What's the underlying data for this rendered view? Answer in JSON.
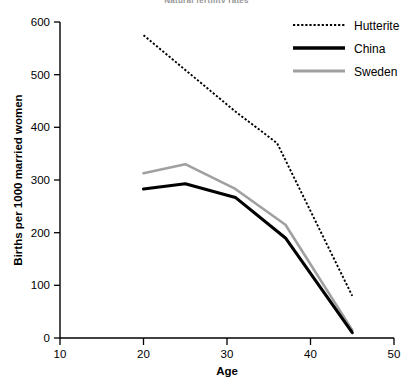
{
  "chart_data": {
    "type": "line",
    "title": "Natural fertility rates",
    "xlabel": "Age",
    "ylabel": "Births per 1000 married women",
    "xlim": [
      10,
      50
    ],
    "ylim": [
      0,
      600
    ],
    "xticks": [
      10,
      20,
      30,
      40,
      50
    ],
    "yticks": [
      0,
      100,
      200,
      300,
      400,
      500,
      600
    ],
    "grid": false,
    "legend_position": "top-right",
    "series": [
      {
        "name": "Hutterite",
        "style": "dotted",
        "color": "#000000",
        "x": [
          20,
          31,
          36,
          45
        ],
        "values": [
          575,
          430,
          370,
          80
        ]
      },
      {
        "name": "China",
        "style": "solid-thick",
        "color": "#000000",
        "x": [
          20,
          25,
          31,
          37,
          45
        ],
        "values": [
          283,
          293,
          267,
          190,
          10
        ]
      },
      {
        "name": "Sweden",
        "style": "solid-gray",
        "color": "#a0a0a0",
        "x": [
          20,
          25,
          31,
          37,
          45
        ],
        "values": [
          313,
          330,
          283,
          215,
          15
        ]
      }
    ]
  },
  "axes": {
    "y_tick_labels": [
      "600",
      "500",
      "400",
      "300",
      "200",
      "100",
      "0"
    ],
    "x_tick_labels": [
      "10",
      "20",
      "30",
      "40",
      "50"
    ],
    "x_axis_title": "Age",
    "y_axis_title": "Births per 1000 married women"
  },
  "legend": {
    "items": [
      {
        "label": "Hutterite",
        "swatch": "dotted-line-swatch"
      },
      {
        "label": "China",
        "swatch": "thick-black-line-swatch"
      },
      {
        "label": "Sweden",
        "swatch": "gray-line-swatch"
      }
    ]
  },
  "colors": {
    "hutterite": "#000000",
    "china": "#000000",
    "sweden": "#a0a0a0",
    "axis": "#000000",
    "background": "#ffffff"
  }
}
